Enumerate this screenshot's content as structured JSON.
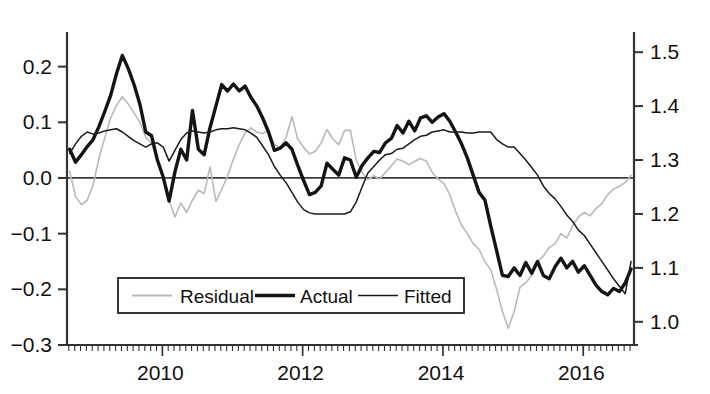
{
  "chart_data": {
    "type": "line",
    "title": "",
    "subtitle": "",
    "xlabel": "",
    "ylabel": "",
    "y2label": "",
    "grid": false,
    "legend_position": "lower-left-inside",
    "xlim": [
      2008.67,
      2016.75
    ],
    "ylim": [
      -0.3,
      0.255
    ],
    "y2lim": [
      0.957,
      1.53
    ],
    "xticks": [
      2010,
      2012,
      2014,
      2016
    ],
    "xticklabels": [
      "2010",
      "2012",
      "2014",
      "2016"
    ],
    "xminor_tick_interval": 0.0833,
    "yticks": [
      0.2,
      0.1,
      0.0,
      -0.1,
      -0.2,
      -0.3
    ],
    "yticklabels": [
      "0.2",
      "0.1",
      "0.0",
      "-0.1",
      "-0.2",
      "-0.3"
    ],
    "y2ticks": [
      1.5,
      1.4,
      1.3,
      1.2,
      1.1,
      1.0
    ],
    "y2ticklabels": [
      "1.5",
      "1.4",
      "1.3",
      "1.2",
      "1.1",
      "1.0"
    ],
    "zero_line": 0.0,
    "x": [
      2008.708,
      2008.792,
      2008.875,
      2008.958,
      2009.042,
      2009.125,
      2009.208,
      2009.292,
      2009.375,
      2009.458,
      2009.542,
      2009.625,
      2009.708,
      2009.792,
      2009.875,
      2009.958,
      2010.042,
      2010.125,
      2010.208,
      2010.292,
      2010.375,
      2010.458,
      2010.542,
      2010.625,
      2010.708,
      2010.792,
      2010.875,
      2010.958,
      2011.042,
      2011.125,
      2011.208,
      2011.292,
      2011.375,
      2011.458,
      2011.542,
      2011.625,
      2011.708,
      2011.792,
      2011.875,
      2011.958,
      2012.042,
      2012.125,
      2012.208,
      2012.292,
      2012.375,
      2012.458,
      2012.542,
      2012.625,
      2012.708,
      2012.792,
      2012.875,
      2012.958,
      2013.042,
      2013.125,
      2013.208,
      2013.292,
      2013.375,
      2013.458,
      2013.542,
      2013.625,
      2013.708,
      2013.792,
      2013.875,
      2013.958,
      2014.042,
      2014.125,
      2014.208,
      2014.292,
      2014.375,
      2014.458,
      2014.542,
      2014.625,
      2014.708,
      2014.792,
      2014.875,
      2014.958,
      2015.042,
      2015.125,
      2015.208,
      2015.292,
      2015.375,
      2015.458,
      2015.542,
      2015.625,
      2015.708,
      2015.792,
      2015.875,
      2015.958,
      2016.042,
      2016.125,
      2016.208,
      2016.292,
      2016.375,
      2016.458,
      2016.542,
      2016.625,
      2016.708
    ],
    "series": [
      {
        "name": "Residual",
        "axis": "left",
        "color": "#b9b9b9",
        "linewidth": 1.6,
        "values": [
          0.012,
          -0.033,
          -0.048,
          -0.04,
          -0.012,
          0.035,
          0.072,
          0.108,
          0.13,
          0.146,
          0.133,
          0.117,
          0.1,
          0.073,
          0.062,
          0.034,
          0.004,
          -0.04,
          -0.07,
          -0.045,
          -0.062,
          -0.04,
          -0.022,
          -0.028,
          0.02,
          -0.042,
          -0.02,
          0.003,
          0.034,
          0.06,
          0.081,
          0.09,
          0.082,
          0.08,
          0.085,
          0.06,
          0.055,
          0.073,
          0.11,
          0.07,
          0.055,
          0.043,
          0.048,
          0.063,
          0.087,
          0.07,
          0.06,
          0.085,
          0.086,
          0.032,
          0.01,
          -0.003,
          0.004,
          -0.002,
          0.01,
          0.022,
          0.034,
          0.03,
          0.024,
          0.03,
          0.035,
          0.03,
          0.01,
          -0.002,
          -0.01,
          -0.03,
          -0.06,
          -0.085,
          -0.1,
          -0.118,
          -0.128,
          -0.15,
          -0.165,
          -0.2,
          -0.24,
          -0.27,
          -0.24,
          -0.196,
          -0.188,
          -0.175,
          -0.15,
          -0.14,
          -0.125,
          -0.118,
          -0.1,
          -0.108,
          -0.086,
          -0.07,
          -0.062,
          -0.068,
          -0.055,
          -0.046,
          -0.03,
          -0.02,
          -0.015,
          -0.008,
          0.005
        ]
      },
      {
        "name": "Actual",
        "axis": "right",
        "color": "#141414",
        "linewidth": 3.4,
        "values": [
          1.32,
          1.296,
          1.31,
          1.325,
          1.338,
          1.362,
          1.39,
          1.42,
          1.46,
          1.494,
          1.47,
          1.44,
          1.404,
          1.352,
          1.345,
          1.3,
          1.268,
          1.224,
          1.278,
          1.32,
          1.3,
          1.392,
          1.32,
          1.31,
          1.36,
          1.4,
          1.44,
          1.428,
          1.441,
          1.428,
          1.437,
          1.416,
          1.4,
          1.378,
          1.352,
          1.318,
          1.322,
          1.332,
          1.32,
          1.29,
          1.262,
          1.236,
          1.24,
          1.252,
          1.294,
          1.283,
          1.272,
          1.304,
          1.3,
          1.268,
          1.29,
          1.304,
          1.316,
          1.314,
          1.332,
          1.34,
          1.364,
          1.35,
          1.372,
          1.354,
          1.378,
          1.382,
          1.37,
          1.38,
          1.386,
          1.372,
          1.352,
          1.33,
          1.304,
          1.272,
          1.24,
          1.226,
          1.178,
          1.132,
          1.086,
          1.084,
          1.1,
          1.086,
          1.11,
          1.09,
          1.112,
          1.086,
          1.08,
          1.102,
          1.118,
          1.1,
          1.112,
          1.092,
          1.104,
          1.086,
          1.068,
          1.056,
          1.05,
          1.062,
          1.056,
          1.072,
          1.098
        ]
      },
      {
        "name": "Fitted",
        "axis": "right",
        "color": "#1a1a1a",
        "linewidth": 1.5,
        "values": [
          1.312,
          1.33,
          1.344,
          1.352,
          1.348,
          1.35,
          1.354,
          1.356,
          1.358,
          1.352,
          1.344,
          1.336,
          1.33,
          1.324,
          1.33,
          1.332,
          1.324,
          1.298,
          1.318,
          1.338,
          1.35,
          1.354,
          1.352,
          1.35,
          1.352,
          1.356,
          1.358,
          1.358,
          1.36,
          1.358,
          1.356,
          1.35,
          1.342,
          1.326,
          1.31,
          1.288,
          1.272,
          1.258,
          1.24,
          1.222,
          1.208,
          1.202,
          1.2,
          1.2,
          1.2,
          1.2,
          1.2,
          1.2,
          1.204,
          1.222,
          1.25,
          1.276,
          1.288,
          1.3,
          1.31,
          1.312,
          1.32,
          1.322,
          1.33,
          1.338,
          1.344,
          1.346,
          1.352,
          1.354,
          1.356,
          1.352,
          1.352,
          1.352,
          1.35,
          1.35,
          1.352,
          1.352,
          1.352,
          1.338,
          1.33,
          1.324,
          1.324,
          1.312,
          1.3,
          1.286,
          1.272,
          1.252,
          1.238,
          1.228,
          1.214,
          1.198,
          1.186,
          1.17,
          1.16,
          1.144,
          1.128,
          1.112,
          1.096,
          1.08,
          1.066,
          1.052,
          1.112
        ]
      }
    ]
  },
  "legend": {
    "items": [
      {
        "label": "Residual",
        "style": "thin-gray"
      },
      {
        "label": "Actual",
        "style": "thick-black"
      },
      {
        "label": "Fitted",
        "style": "thin-black"
      }
    ]
  },
  "axes": {
    "left_tick_labels": [
      "0.2",
      "0.1",
      "0.0",
      "-0.1",
      "-0.2",
      "-0.3"
    ],
    "right_tick_labels": [
      "1.5",
      "1.4",
      "1.3",
      "1.2",
      "1.1",
      "1.0"
    ],
    "x_tick_labels": [
      "2010",
      "2012",
      "2014",
      "2016"
    ]
  },
  "colors": {
    "residual": "#b9b9b9",
    "actual": "#141414",
    "fitted": "#1a1a1a",
    "axis": "#333333",
    "background": "#ffffff"
  }
}
